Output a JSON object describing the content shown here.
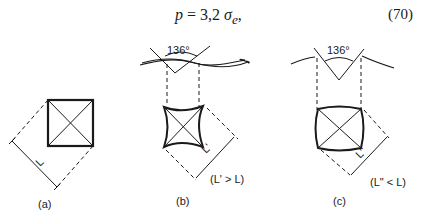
{
  "equation": {
    "lhs": "p",
    "equals": "=",
    "coefficient": "3,2",
    "symbol": "σ",
    "subscript": "e",
    "trailing": ",",
    "number": "(70)"
  },
  "figure": {
    "panels": [
      {
        "id": "a",
        "caption": "(a)",
        "dimension_label": "L",
        "relation": ""
      },
      {
        "id": "b",
        "caption": "(b)",
        "dimension_label": "L'",
        "relation": "(L' > L)",
        "angle": "136°"
      },
      {
        "id": "c",
        "caption": "(c)",
        "dimension_label": "L\"",
        "relation": "(L\" < L)",
        "angle": "136°"
      }
    ]
  }
}
